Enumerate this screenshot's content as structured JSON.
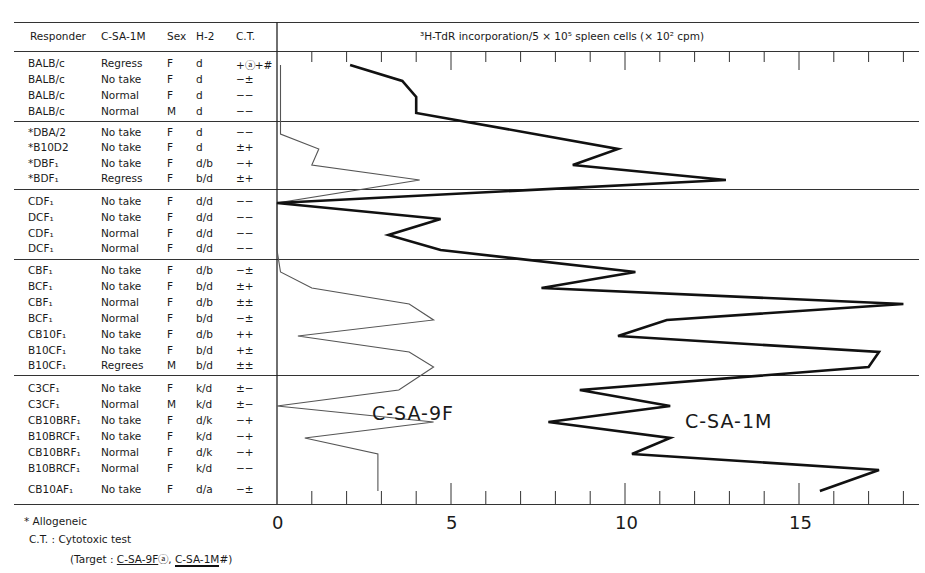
{
  "table": {
    "headers": {
      "responder": "Responder",
      "tumor": "C-SA-1M",
      "sex": "Sex",
      "h2": "H-2",
      "ct": "C.T."
    },
    "groups": [
      {
        "rows": [
          {
            "responder": "BALB/c",
            "tumor": "Regress",
            "sex": "F",
            "h2": "d",
            "ct": "+ⓐ+#"
          },
          {
            "responder": "BALB/c",
            "tumor": "No take",
            "sex": "F",
            "h2": "d",
            "ct": "−±"
          },
          {
            "responder": "BALB/c",
            "tumor": "Normal",
            "sex": "F",
            "h2": "d",
            "ct": "−−"
          },
          {
            "responder": "BALB/c",
            "tumor": "Normal",
            "sex": "M",
            "h2": "d",
            "ct": "−−"
          }
        ]
      },
      {
        "rows": [
          {
            "responder": "*DBA/2",
            "tumor": "No take",
            "sex": "F",
            "h2": "d",
            "ct": "−−"
          },
          {
            "responder": "*B10D2",
            "tumor": "No take",
            "sex": "F",
            "h2": "d",
            "ct": "±+"
          },
          {
            "responder": "*DBF₁",
            "tumor": "No take",
            "sex": "F",
            "h2": "d/b",
            "ct": "−+"
          },
          {
            "responder": "*BDF₁",
            "tumor": "Regress",
            "sex": "F",
            "h2": "b/d",
            "ct": "±+"
          }
        ]
      },
      {
        "rows": [
          {
            "responder": "CDF₁",
            "tumor": "No take",
            "sex": "F",
            "h2": "d/d",
            "ct": "−−"
          },
          {
            "responder": "DCF₁",
            "tumor": "No take",
            "sex": "F",
            "h2": "d/d",
            "ct": "−−"
          },
          {
            "responder": "CDF₁",
            "tumor": "Normal",
            "sex": "F",
            "h2": "d/d",
            "ct": "−−"
          },
          {
            "responder": "DCF₁",
            "tumor": "Normal",
            "sex": "F",
            "h2": "d/d",
            "ct": "−−"
          }
        ]
      },
      {
        "rows": [
          {
            "responder": "CBF₁",
            "tumor": "No take",
            "sex": "F",
            "h2": "d/b",
            "ct": "−±"
          },
          {
            "responder": "BCF₁",
            "tumor": "No take",
            "sex": "F",
            "h2": "b/d",
            "ct": "±+"
          },
          {
            "responder": "CBF₁",
            "tumor": "Normal",
            "sex": "F",
            "h2": "d/b",
            "ct": "±±"
          },
          {
            "responder": "BCF₁",
            "tumor": "Normal",
            "sex": "F",
            "h2": "b/d",
            "ct": "−±"
          },
          {
            "responder": "CB10F₁",
            "tumor": "No take",
            "sex": "F",
            "h2": "d/b",
            "ct": "++"
          },
          {
            "responder": "B10CF₁",
            "tumor": "No take",
            "sex": "F",
            "h2": "b/d",
            "ct": "+±"
          },
          {
            "responder": "B10CF₁",
            "tumor": "Regrees",
            "sex": "M",
            "h2": "b/d",
            "ct": "±±"
          }
        ]
      },
      {
        "rows": [
          {
            "responder": "C3CF₁",
            "tumor": "No take",
            "sex": "F",
            "h2": "k/d",
            "ct": "±−"
          },
          {
            "responder": "C3CF₁",
            "tumor": "Normal",
            "sex": "M",
            "h2": "k/d",
            "ct": "±−"
          },
          {
            "responder": "CB10BRF₁",
            "tumor": "No take",
            "sex": "F",
            "h2": "d/k",
            "ct": "−+"
          },
          {
            "responder": "B10BRCF₁",
            "tumor": "No take",
            "sex": "F",
            "h2": "k/d",
            "ct": "−+"
          },
          {
            "responder": "CB10BRF₁",
            "tumor": "Normal",
            "sex": "F",
            "h2": "d/k",
            "ct": "−+"
          },
          {
            "responder": "B10BRCF₁",
            "tumor": "Normal",
            "sex": "F",
            "h2": "k/d",
            "ct": "−−"
          },
          {
            "responder": "CB10AF₁",
            "tumor": "No take",
            "sex": "F",
            "h2": "d/a",
            "ct": "−±"
          }
        ]
      }
    ]
  },
  "footnotes": {
    "allogeneic": "* Allogeneic",
    "ct": "C.T. : Cytotoxic test",
    "target_prefix": "(Target : ",
    "target_9f": "C-SA-9F",
    "target_sep": "ⓐ, ",
    "target_1m": "C-SA-1M",
    "target_suffix": "#)"
  },
  "chart_data": {
    "type": "line",
    "orientation": "horizontal",
    "title": "³H-TdR incorporation/5 × 10⁵ spleen cells (× 10² cpm)",
    "xlabel": "³H-TdR incorporation/5 × 10⁵ spleen cells (× 10² cpm)",
    "xlim": [
      0,
      18
    ],
    "xticks": [
      0,
      5,
      10,
      15
    ],
    "xtick_labels": [
      "0",
      "5",
      "10",
      "15"
    ],
    "minor_tick_step": 1,
    "categories": [
      "BALB/c F Regress",
      "BALB/c F No take",
      "BALB/c F Normal",
      "BALB/c M Normal",
      "DBA/2",
      "B10D2",
      "DBF1",
      "BDF1",
      "CDF1 No take",
      "DCF1 No take",
      "CDF1 Normal",
      "DCF1 Normal",
      "CBF1 No take",
      "BCF1 No take",
      "CBF1 Normal",
      "BCF1 Normal",
      "CB10F1 No take",
      "B10CF1 No take",
      "B10CF1 Regrees",
      "C3CF1 No take",
      "C3CF1 Normal",
      "CB10BRF1 No take",
      "B10BRCF1 No take",
      "CB10BRF1 Normal",
      "B10BRCF1 Normal",
      "CB10AF1 No take"
    ],
    "series": [
      {
        "name": "C-SA-9F",
        "style": "thin",
        "values": [
          0.1,
          0.1,
          0.1,
          0.1,
          0.1,
          1.2,
          1.0,
          4.1,
          0.0,
          0.0,
          0.0,
          0.0,
          0.1,
          1.0,
          3.8,
          4.5,
          0.6,
          3.8,
          4.5,
          3.5,
          0.0,
          4.5,
          0.8,
          2.9,
          2.9,
          2.9
        ]
      },
      {
        "name": "C-SA-1M",
        "style": "thick",
        "values": [
          2.1,
          3.6,
          4.0,
          4.0,
          7.4,
          9.8,
          8.5,
          12.9,
          0.0,
          4.7,
          3.2,
          4.7,
          10.3,
          7.6,
          18.0,
          11.2,
          9.8,
          17.3,
          17.0,
          8.7,
          11.3,
          7.8,
          11.3,
          10.2,
          17.3,
          15.6
        ]
      }
    ],
    "annotations": [
      "C-SA-9F",
      "C-SA-1M"
    ],
    "grid": false,
    "legend": "inline labels"
  }
}
